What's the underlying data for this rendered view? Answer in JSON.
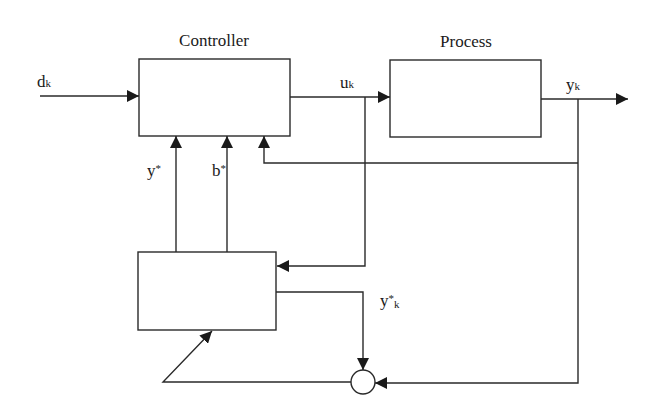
{
  "diagram": {
    "blocks": {
      "controller": {
        "label": "Controller"
      },
      "process": {
        "label": "Process"
      },
      "estimator": {
        "label": ""
      }
    },
    "signals": {
      "dk": {
        "main": "d",
        "sub": "k"
      },
      "uk": {
        "main": "u",
        "sub": "k"
      },
      "yk": {
        "main": "y",
        "sub": "k"
      },
      "ystar": {
        "main": "y",
        "sup": "*"
      },
      "bstar": {
        "main": "b",
        "sup": "*"
      },
      "ystark": {
        "main": "y",
        "sup": "*",
        "sub": "k"
      }
    },
    "colors": {
      "stroke": "#2a2a2a",
      "background": "#ffffff"
    }
  }
}
